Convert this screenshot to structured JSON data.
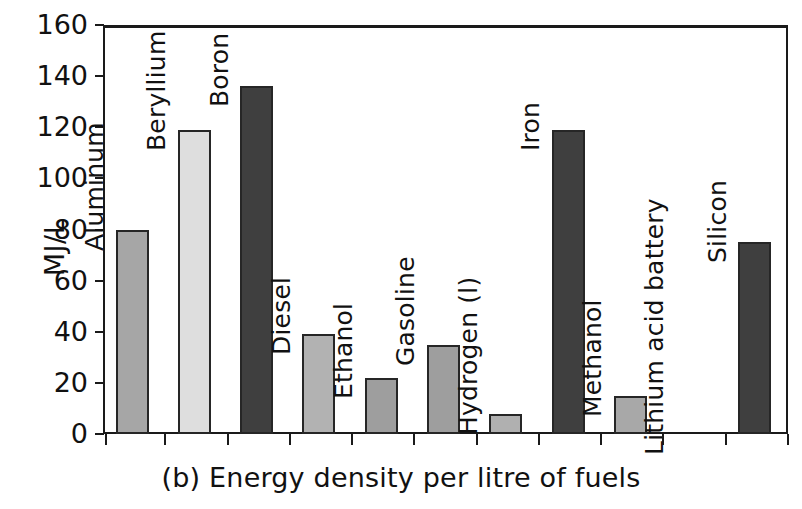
{
  "chart_data": {
    "type": "bar",
    "title": "(b) Energy density per litre of fuels",
    "xlabel": "",
    "ylabel": "MJ/L",
    "ylim": [
      0,
      160
    ],
    "ytick_labels": [
      "0",
      "20",
      "40",
      "60",
      "80",
      "100",
      "120",
      "140",
      "160"
    ],
    "ytick_values": [
      0,
      20,
      40,
      60,
      80,
      100,
      120,
      140,
      160
    ],
    "grid": false,
    "legend": "none",
    "categories": [
      "Aluminum",
      "Beryllium",
      "Boron",
      "Diesel",
      "Ethanol",
      "Gasoline",
      "Hydrogen (l)",
      "Iron",
      "Methanol",
      "Lithium acid battery",
      "Silicon"
    ],
    "values": [
      80,
      119,
      136,
      39,
      22,
      35,
      8,
      119,
      15,
      0,
      75
    ],
    "bar_colors": [
      "#a6a6a6",
      "#dedede",
      "#3f3f3f",
      "#b2b2b2",
      "#9e9e9e",
      "#9e9e9e",
      "#b0b0b0",
      "#3f3f3f",
      "#a8a8a8",
      "#ffffff",
      "#3f3f3f"
    ]
  },
  "caption": "(b) Energy density per litre of fuels",
  "axis": {
    "y_title": "MJ/L"
  }
}
